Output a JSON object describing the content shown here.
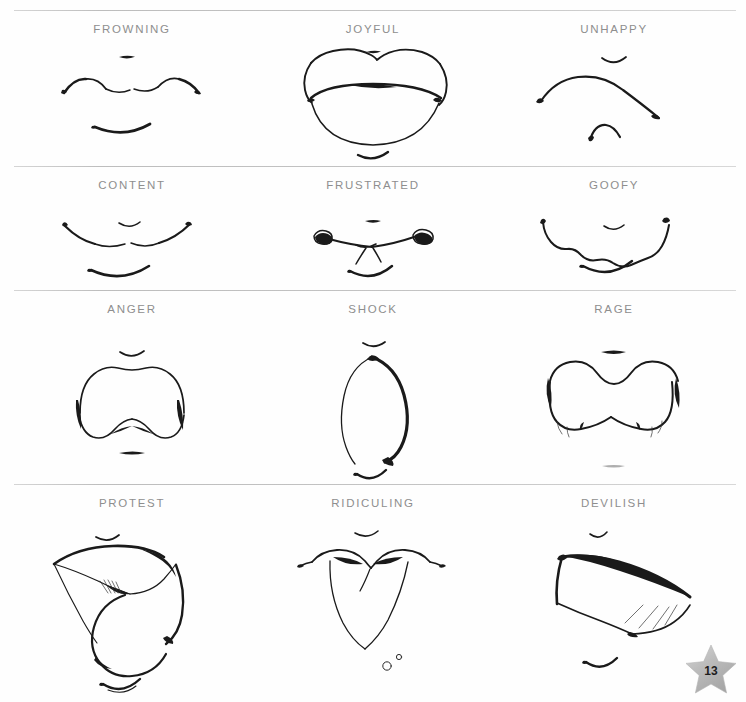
{
  "page": {
    "number": "13",
    "badge_icon": "star-icon",
    "badge_color": "#b9b9b9",
    "background_color": "#fefefe",
    "ink_color": "#1a1a1a",
    "label_color": "#8e8e8e",
    "rule_color": "#c9c9c9"
  },
  "rows": [
    {
      "row_name": "row-1",
      "cells": [
        {
          "label": "FROWNING",
          "art": "frowning-mouth"
        },
        {
          "label": "JOYFUL",
          "art": "joyful-mouth"
        },
        {
          "label": "UNHAPPY",
          "art": "unhappy-mouth"
        }
      ]
    },
    {
      "row_name": "row-2",
      "cells": [
        {
          "label": "CONTENT",
          "art": "content-mouth"
        },
        {
          "label": "FRUSTRATED",
          "art": "frustrated-mouth"
        },
        {
          "label": "GOOFY",
          "art": "goofy-mouth"
        }
      ]
    },
    {
      "row_name": "row-3",
      "cells": [
        {
          "label": "ANGER",
          "art": "anger-mouth"
        },
        {
          "label": "SHOCK",
          "art": "shock-mouth"
        },
        {
          "label": "RAGE",
          "art": "rage-mouth"
        }
      ]
    },
    {
      "row_name": "row-4",
      "cells": [
        {
          "label": "PROTEST",
          "art": "protest-mouth"
        },
        {
          "label": "RIDICULING",
          "art": "ridiculing-mouth"
        },
        {
          "label": "DEVILISH",
          "art": "devilish-mouth"
        }
      ]
    }
  ]
}
